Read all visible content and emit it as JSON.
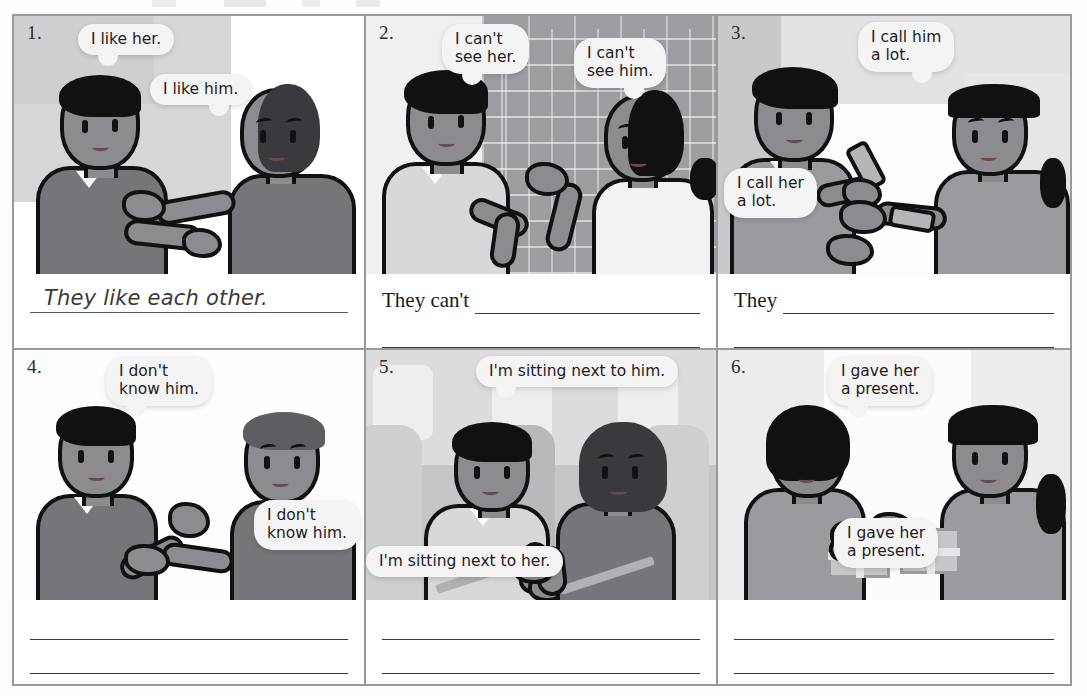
{
  "page": {
    "type": "workbook-exercise",
    "layout": "2 rows x 3 columns",
    "colors": {
      "border": "#9a9a9e",
      "rule": "#3a3a3a",
      "bubble_fill": "#f4f4f5",
      "ink": "#1a1a1a",
      "skin": "#8c8c90",
      "hair": "#111111"
    }
  },
  "items": [
    {
      "number": "1.",
      "bubbles": [
        {
          "text": "I like her.",
          "speaker": "left"
        },
        {
          "text": "I like him.",
          "speaker": "right"
        }
      ],
      "prompt": "",
      "answer": "They like each other.",
      "answered": true,
      "extra_line": false
    },
    {
      "number": "2.",
      "bubbles": [
        {
          "text": "I can't\nsee her.",
          "speaker": "left"
        },
        {
          "text": "I can't\nsee him.",
          "speaker": "right"
        }
      ],
      "prompt": "They can't",
      "answer": "",
      "answered": false,
      "extra_line": true
    },
    {
      "number": "3.",
      "bubbles": [
        {
          "text": "I call her\na lot.",
          "speaker": "left"
        },
        {
          "text": "I call him\na lot.",
          "speaker": "right"
        }
      ],
      "prompt": "They",
      "answer": "",
      "answered": false,
      "extra_line": true
    },
    {
      "number": "4.",
      "bubbles": [
        {
          "text": "I don't\nknow him.",
          "speaker": "left"
        },
        {
          "text": "I don't\nknow him.",
          "speaker": "right"
        }
      ],
      "prompt": "",
      "answer": "",
      "answered": false,
      "extra_line": true
    },
    {
      "number": "5.",
      "bubbles": [
        {
          "text": "I'm sitting next to her.",
          "speaker": "left"
        },
        {
          "text": "I'm sitting next to him.",
          "speaker": "right"
        }
      ],
      "prompt": "",
      "answer": "",
      "answered": false,
      "extra_line": true
    },
    {
      "number": "6.",
      "bubbles": [
        {
          "text": "I gave her\na present.",
          "speaker": "left"
        },
        {
          "text": "I gave her\na present.",
          "speaker": "right"
        }
      ],
      "prompt": "",
      "answer": "",
      "answered": false,
      "extra_line": true
    }
  ]
}
